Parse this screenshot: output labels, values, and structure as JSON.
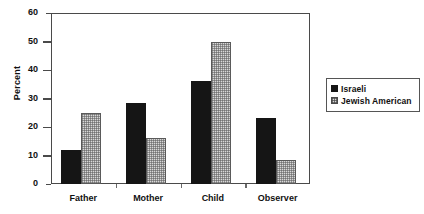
{
  "chart_data": {
    "type": "bar",
    "title": "",
    "xlabel": "",
    "ylabel": "Percent",
    "ylim": [
      0,
      60
    ],
    "yticks": [
      0,
      10,
      20,
      30,
      40,
      50,
      60
    ],
    "ytick_labels": [
      "0",
      "10",
      "20",
      "30",
      "40",
      "50",
      "60"
    ],
    "grid": false,
    "legend_position": "right",
    "categories": [
      "Father",
      "Mother",
      "Child",
      "Observer"
    ],
    "series": [
      {
        "name": "Israeli",
        "color": "#151515",
        "pattern": "solid-black",
        "values": [
          12,
          28.5,
          36,
          23
        ]
      },
      {
        "name": "Jewish  American",
        "color": "#d8d8d8",
        "pattern": "checkered-gray",
        "values": [
          25,
          16,
          50,
          8.5
        ]
      }
    ]
  },
  "legend": {
    "items": [
      {
        "label": "Israeli",
        "swatch": "solid-black-swatch"
      },
      {
        "label": "Jewish  American",
        "swatch": "checkered-gray-swatch"
      }
    ]
  }
}
